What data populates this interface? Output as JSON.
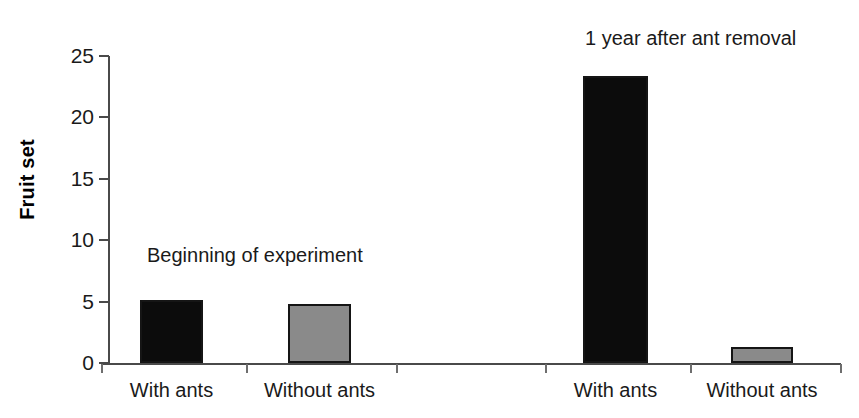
{
  "chart_data": {
    "type": "bar",
    "title": "",
    "xlabel": "",
    "ylabel": "Fruit set",
    "ylim": [
      0,
      25
    ],
    "yticks": [
      0,
      5,
      10,
      15,
      20,
      25
    ],
    "ytick_labels": [
      "0",
      "5",
      "10",
      "15",
      "20",
      "25"
    ],
    "grid": false,
    "legend": "none",
    "categories": [
      "With ants",
      "Without ants",
      "With ants",
      "Without ants"
    ],
    "values": [
      5.1,
      4.8,
      23.4,
      1.3
    ],
    "bar_colors": [
      "#0c0c0c",
      "#8a8a8a",
      "#0c0c0c",
      "#8a8a8a"
    ],
    "groups": [
      {
        "annotation": "Beginning of experiment",
        "categories": [
          "With ants",
          "Without ants"
        ],
        "values": [
          5.1,
          4.8
        ]
      },
      {
        "annotation": "1 year after ant removal",
        "categories": [
          "With ants",
          "Without ants"
        ],
        "values": [
          23.4,
          1.3
        ]
      }
    ],
    "annotations": [
      "Beginning of experiment",
      "1 year after ant removal"
    ]
  },
  "axes": {
    "y": {
      "title": "Fruit set",
      "ticks": [
        {
          "label": "25",
          "value": 25
        },
        {
          "label": "20",
          "value": 20
        },
        {
          "label": "15",
          "value": 15
        },
        {
          "label": "10",
          "value": 10
        },
        {
          "label": "5",
          "value": 5
        },
        {
          "label": "0",
          "value": 0
        }
      ]
    },
    "x": {
      "labels": [
        "With ants",
        "Without ants",
        "With ants",
        "Without ants"
      ]
    }
  },
  "bars": [
    {
      "name": "bar-1",
      "label": "With ants",
      "value": 5.1,
      "color": "#0c0c0c",
      "group": "Beginning of experiment"
    },
    {
      "name": "bar-2",
      "label": "Without ants",
      "value": 4.8,
      "color": "#8a8a8a",
      "group": "Beginning of experiment"
    },
    {
      "name": "bar-3",
      "label": "With ants",
      "value": 23.4,
      "color": "#0c0c0c",
      "group": "1 year after ant removal"
    },
    {
      "name": "bar-4",
      "label": "Without ants",
      "value": 1.3,
      "color": "#8a8a8a",
      "group": "1 year after ant removal"
    }
  ],
  "annotations": {
    "left": "Beginning of experiment",
    "right": "1 year after ant removal"
  },
  "colors": {
    "bar_dark": "#0c0c0c",
    "bar_gray": "#8a8a8a",
    "axis": "#4a4a4a",
    "text": "#1a1a1a",
    "background": "#ffffff"
  }
}
